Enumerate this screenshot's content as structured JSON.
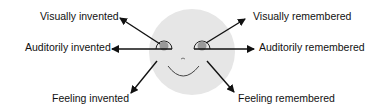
{
  "diagram": {
    "colors": {
      "face_fill": "#e6e6e6",
      "pupil_fill": "#999999",
      "stroke": "#111111",
      "text": "#111111"
    },
    "labels": {
      "visually_invented": "Visually invented",
      "auditorily_invented": "Auditorily invented",
      "feeling_invented": "Feeling invented",
      "visually_remembered": "Visually remembered",
      "auditorily_remembered": "Auditorily remembered",
      "feeling_remembered": "Feeling remembered"
    }
  }
}
